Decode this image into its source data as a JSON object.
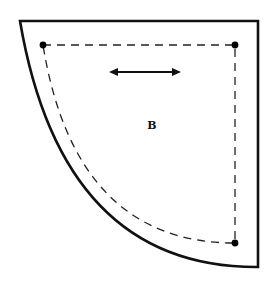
{
  "diagram": {
    "type": "quilt-pattern-template",
    "piece_label": "B",
    "shape": "quarter-circle",
    "colors": {
      "background": "#ffffff",
      "outline": "#111111",
      "seam_line": "#222222",
      "dots": "#000000"
    },
    "markers": {
      "grainline_arrow": "double-headed horizontal arrow",
      "corner_dots": 3,
      "seam_line_style": "dashed"
    }
  }
}
